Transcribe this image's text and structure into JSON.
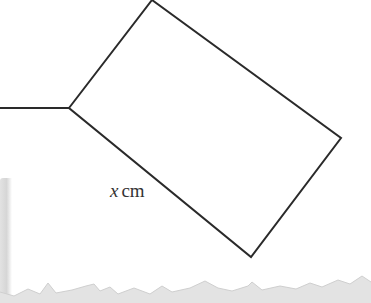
{
  "diagram": {
    "type": "geometry-figure",
    "shape": "rectangle-with-attached-line",
    "stroke_color": "#2a2a2a",
    "stroke_width": 2,
    "vertices": {
      "left": [
        69,
        108
      ],
      "top": [
        152,
        0
      ],
      "right": [
        341,
        138
      ],
      "bottom": [
        251,
        257
      ]
    },
    "attached_line": {
      "from": [
        0,
        108
      ],
      "to": [
        69,
        108
      ]
    },
    "side_label": {
      "variable": "x",
      "unit": "cm",
      "side": "left-to-bottom"
    }
  },
  "decoration": {
    "torn_edge_color": "#dcdcdc",
    "shadow_color": "#d6d6d6"
  }
}
